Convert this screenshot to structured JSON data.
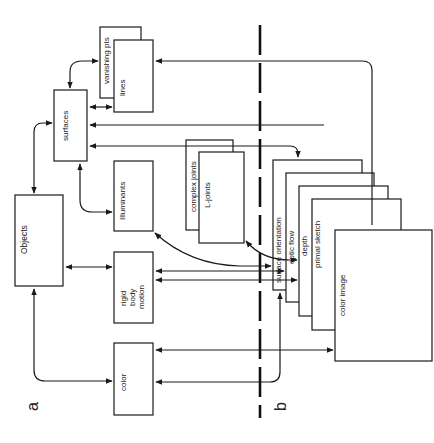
{
  "diagram": {
    "panels": [
      {
        "id": "a",
        "label": "a"
      },
      {
        "id": "b",
        "label": "b"
      }
    ],
    "nodes": {
      "objects": {
        "label": "Objects"
      },
      "surfaces": {
        "label": "surfaces"
      },
      "vanishing_pts": {
        "label": "vanishing pts"
      },
      "lines": {
        "label": "lines"
      },
      "illuminants": {
        "label": "Illuminants"
      },
      "complex_joints": {
        "label": "complex joints"
      },
      "l_joints": {
        "label": "L-joints"
      },
      "rigid_body_motion": {
        "line1": "rigid",
        "line2": "body",
        "line3": "motion"
      },
      "color": {
        "label": "color"
      },
      "surface_orientation": {
        "label": "surface orientation"
      },
      "optic_flow": {
        "label": "optic flow"
      },
      "depth": {
        "label": "depth"
      },
      "primal_sketch": {
        "label": "primal sketch"
      },
      "color_image": {
        "label": "color image"
      }
    },
    "edges": [
      {
        "from": "surfaces",
        "to": "vanishing_pts",
        "type": "bidirectional"
      },
      {
        "from": "surfaces",
        "to": "lines",
        "type": "bidirectional"
      },
      {
        "from": "primal_sketch",
        "to": "lines",
        "type": "directed"
      },
      {
        "from": "primal_sketch",
        "to": "surfaces",
        "type": "directed"
      },
      {
        "from": "surfaces",
        "to": "surface_orientation",
        "type": "directed"
      },
      {
        "from": "surfaces",
        "to": "complex_joints",
        "type": "bidirectional"
      },
      {
        "from": "surfaces",
        "to": "objects",
        "type": "bidirectional"
      },
      {
        "from": "surfaces",
        "to": "illuminants",
        "type": "bidirectional"
      },
      {
        "from": "objects",
        "to": "rigid_body_motion",
        "type": "bidirectional"
      },
      {
        "from": "objects",
        "to": "color",
        "type": "bidirectional"
      },
      {
        "from": "illuminants",
        "to": "surface_orientation",
        "type": "bidirectional"
      },
      {
        "from": "l_joints",
        "to": "depth",
        "type": "bidirectional"
      },
      {
        "from": "rigid_body_motion",
        "to": "surface_orientation",
        "type": "bidirectional"
      },
      {
        "from": "rigid_body_motion",
        "to": "optic_flow",
        "type": "bidirectional"
      },
      {
        "from": "color_image",
        "to": "color",
        "type": "directed"
      },
      {
        "from": "color",
        "to": "surface_orientation",
        "type": "directed"
      }
    ]
  }
}
